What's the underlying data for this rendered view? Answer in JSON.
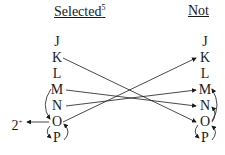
{
  "headers": {
    "selected": "Selected",
    "selected_sup": "5",
    "not": "Not"
  },
  "left_column": [
    "J",
    "K",
    "L",
    "M",
    "N",
    "O",
    "P"
  ],
  "right_column": [
    "J",
    "K",
    "L",
    "M",
    "N",
    "O",
    "P"
  ],
  "outgoing_label": "2",
  "outgoing_sup": "+",
  "edges": [
    {
      "from": "left.K",
      "to": "right.O"
    },
    {
      "from": "left.O",
      "to": "right.K"
    },
    {
      "from": "left.M",
      "to": "right.N"
    },
    {
      "from": "left.N",
      "to": "right.M"
    },
    {
      "from": "left.O",
      "to": "outgoing_2+"
    },
    {
      "from": "left.M",
      "to": "left.O",
      "curved": true
    },
    {
      "from": "left.O",
      "to": "left.P",
      "curved": true
    },
    {
      "from": "left.P",
      "to": "left.O",
      "curved": true
    },
    {
      "from": "right.O",
      "to": "right.M",
      "curved": true
    },
    {
      "from": "right.O",
      "to": "right.N",
      "curved": true
    },
    {
      "from": "right.O",
      "to": "right.P",
      "curved": true
    },
    {
      "from": "right.P",
      "to": "right.O",
      "curved": true
    }
  ]
}
